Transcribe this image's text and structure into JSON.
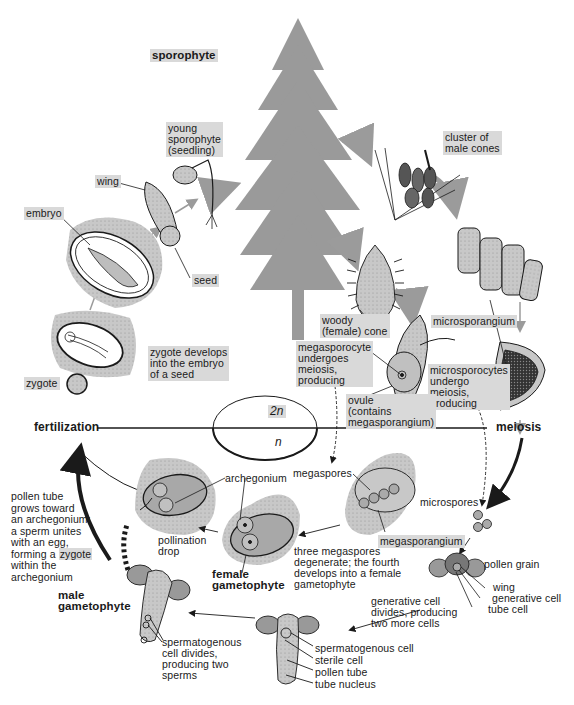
{
  "diagram": {
    "phases": {
      "diploid": "2n",
      "haploid": "n"
    },
    "stages": {
      "sporophyte": "sporophyte",
      "fertilization": "fertilization",
      "meiosis": "meiosis",
      "female_gametophyte": "female\ngametophyte",
      "male_gametophyte": "male\ngametophyte"
    },
    "labels": {
      "young_sporophyte": "young\nsporophyte\n(seedling)",
      "wing": "wing",
      "embryo": "embryo",
      "seed": "seed",
      "cluster_male_cones": "cluster of\nmale cones",
      "woody_cone": "woody\n(female) cone",
      "microsporangium": "microsporangium",
      "megasporocyte": "megasporocyte\nundergoes\nmeiosis,\nproducing",
      "ovule": "ovule\n(contains\nmegasporangium)",
      "microsporocytes": "microsporocytes\nundergo\nmeiosis,\nproducing",
      "zygote_develops": "zygote develops\ninto the embryo\nof a seed",
      "zygote": "zygote",
      "pollen_tube_text_a": "pollen tube\ngrows toward\nan archegonium;\na sperm unites\nwith an egg,\nforming a ",
      "pollen_tube_text_zygote": "zygote",
      "pollen_tube_text_b": "within the\narchegonium",
      "archegonium": "archegonium",
      "pollination_drop": "pollination\ndrop",
      "megaspores": "megaspores",
      "megasporangium": "megasporangium",
      "three_megaspores": "three megaspores\ndegenerate; the fourth\ndevelops into a female\ngametophyte",
      "microspores": "microspores",
      "pollen_grain": "pollen grain",
      "pg_wing": "wing",
      "pg_generative_cell": "generative cell",
      "pg_tube_cell": "tube cell",
      "generative_divides": "generative cell\ndivides, producing\ntwo more cells",
      "spermatogenous_cell": "spermatogenous cell",
      "sterile_cell": "sterile cell",
      "pollen_tube": "pollen tube",
      "tube_nucleus": "tube nucleus",
      "spermatogenous_divides": "spermatogenous\ncell divides,\nproducing two\nsperms"
    },
    "colors": {
      "tree": "#9a9a9a",
      "tissue": "#c8c8c8",
      "tissue_dark": "#a8a8a8",
      "label_bg": "#d9d9d9",
      "ink": "#1a1a1a",
      "arrow_gray": "#9b9b9b"
    }
  }
}
